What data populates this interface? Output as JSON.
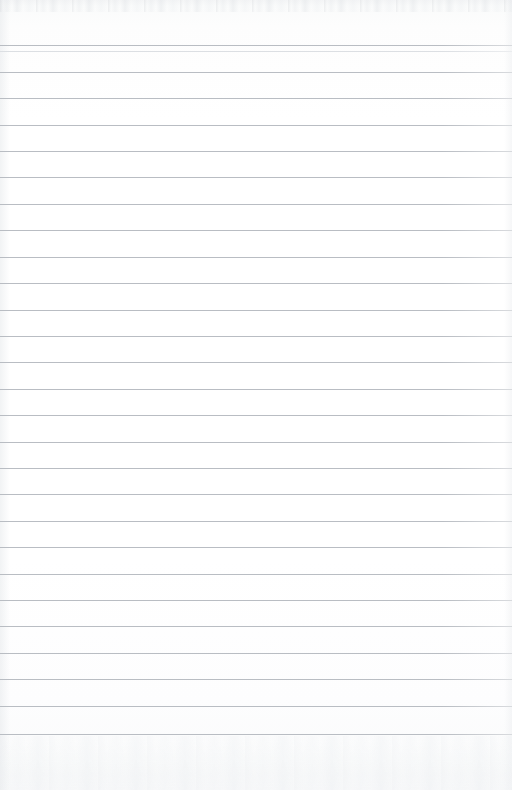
{
  "document": {
    "kind": "scanned-blank-ruled-page",
    "caption": "Blank lined notebook page",
    "width_px": 512,
    "height_px": 790,
    "text_content": "",
    "handwriting_present": "no",
    "printed_text_present": "no"
  },
  "paper": {
    "background_color": "#fcfcfd",
    "highlight_color": "#ffffff",
    "top_band_color": "#f4f5f6",
    "bottom_band_color": "#f7f8f9"
  },
  "rules": {
    "line_color": "#b9bdc3",
    "secondary_line_color": "#dcdfe3",
    "line_thickness_px": 1,
    "line_spacing_px": 26.5,
    "first_line_y_px": 45,
    "last_line_y_px": 734,
    "line_count": 27,
    "full_bleed": "yes",
    "left_margin_rule": "none",
    "positions_y_px": [
      45,
      51,
      72,
      98,
      125,
      151,
      177,
      204,
      230,
      257,
      283,
      310,
      336,
      362,
      389,
      415,
      442,
      468,
      494,
      521,
      547,
      574,
      600,
      626,
      653,
      679,
      706,
      734
    ]
  },
  "margins": {
    "top_blank_height_px": 45,
    "bottom_blank_height_px": 56
  },
  "texture": {
    "top_noise_band_height_px": 12,
    "bottom_noise_band_height_px": 54,
    "left_gutter_shadow_width_px": 10,
    "right_edge_shadow_width_px": 8
  }
}
